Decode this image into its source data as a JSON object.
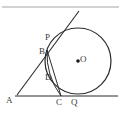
{
  "figure": {
    "background_color": "#ffffff",
    "stroke_color": "#2b2b2b",
    "label_color": "#3a3a3a",
    "top_rule": {
      "name": "top-horizontal-rule",
      "y": 7,
      "x_start": 2,
      "x_end": 119,
      "color": "#9a9a9a"
    },
    "circle": {
      "name": "main-circle",
      "center_x": 78,
      "center_y": 61,
      "radius": 33,
      "center_dot_radius": 1.8
    },
    "baseline": {
      "name": "baseline-AQ",
      "x_start": 15,
      "y_start": 96,
      "x_end": 118,
      "y_end": 96
    },
    "tangent_line": {
      "name": "tangent-line-through-P",
      "x_start": 17,
      "y_start": 95,
      "x_end": 79,
      "y_end": 11
    },
    "chord_line": {
      "name": "segment-B-to-C",
      "x_start": 47,
      "y_start": 50,
      "x_end": 61,
      "y_end": 96
    },
    "labels": [
      {
        "id": "A",
        "text": "A",
        "x": 6,
        "y": 96,
        "role": "vertex-of-angle"
      },
      {
        "id": "B",
        "text": "B",
        "x": 39,
        "y": 47,
        "role": "point-on-tangent"
      },
      {
        "id": "C",
        "text": "C",
        "x": 56,
        "y": 98,
        "role": "point-on-baseline"
      },
      {
        "id": "D",
        "text": "D",
        "x": 45,
        "y": 73,
        "role": "point-on-circle"
      },
      {
        "id": "P",
        "text": "P",
        "x": 45,
        "y": 33,
        "role": "tangent-point-upper"
      },
      {
        "id": "Q",
        "text": "Q",
        "x": 71,
        "y": 98,
        "role": "tangent-point-lower"
      },
      {
        "id": "O",
        "text": "O",
        "x": 80,
        "y": 55,
        "role": "circle-center"
      }
    ]
  }
}
